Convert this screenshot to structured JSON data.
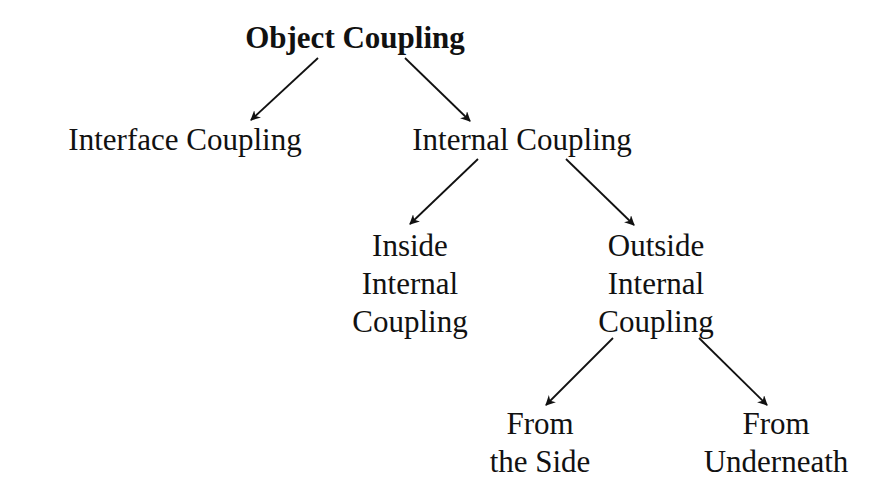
{
  "diagram": {
    "type": "tree",
    "nodes": {
      "root": {
        "lines": [
          "Object Coupling"
        ]
      },
      "interface": {
        "lines": [
          "Interface Coupling"
        ]
      },
      "internal": {
        "lines": [
          "Internal Coupling"
        ]
      },
      "inside": {
        "lines": [
          "Inside",
          "Internal",
          "Coupling"
        ]
      },
      "outside": {
        "lines": [
          "Outside",
          "Internal",
          "Coupling"
        ]
      },
      "side": {
        "lines": [
          "From",
          "the Side"
        ]
      },
      "underneath": {
        "lines": [
          "From",
          "Underneath"
        ]
      }
    },
    "edges": [
      {
        "from": "root",
        "to": "interface"
      },
      {
        "from": "root",
        "to": "internal"
      },
      {
        "from": "internal",
        "to": "inside"
      },
      {
        "from": "internal",
        "to": "outside"
      },
      {
        "from": "outside",
        "to": "side"
      },
      {
        "from": "outside",
        "to": "underneath"
      }
    ],
    "line_color": "#111111"
  }
}
